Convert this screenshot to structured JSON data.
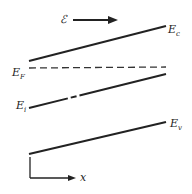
{
  "diagram": {
    "field": {
      "symbol": "ℰ",
      "direction": "right"
    },
    "bands": [
      {
        "name": "E",
        "sub": "c",
        "style": "solid"
      },
      {
        "name": "E",
        "sub": "F",
        "style": "dashed"
      },
      {
        "name": "E",
        "sub": "i",
        "style": "dash-dot"
      },
      {
        "name": "E",
        "sub": "v",
        "style": "solid"
      }
    ],
    "axis": {
      "label": "x"
    }
  }
}
